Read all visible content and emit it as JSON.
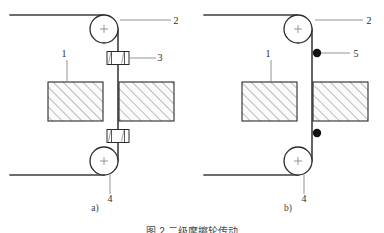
{
  "figure": {
    "caption": "图 2  二级摩擦轮传动",
    "panels": [
      {
        "id": "a",
        "label": "a)",
        "label_x": 95,
        "label_y": 211,
        "origin_x": 0,
        "callouts": [
          {
            "id": "1",
            "text": "1",
            "text_x": 64,
            "text_y": 57,
            "leader": "vertical",
            "lx1": 67,
            "ly1": 60,
            "lx2": 67,
            "ly2": 82
          },
          {
            "id": "2",
            "text": "2",
            "text_x": 176,
            "text_y": 24,
            "leader": "horizontal",
            "lx1": 120,
            "ly1": 20,
            "lx2": 171,
            "ly2": 20
          },
          {
            "id": "3",
            "text": "3",
            "text_x": 160,
            "text_y": 61,
            "leader": "horizontal",
            "lx1": 124,
            "ly1": 58,
            "lx2": 156,
            "ly2": 58
          },
          {
            "id": "4",
            "text": "4",
            "text_x": 108,
            "text_y": 200,
            "leader": "vertical",
            "lx1": 110,
            "ly1": 175,
            "lx2": 110,
            "ly2": 194
          }
        ],
        "pulleys": [
          {
            "name": "top-pulley",
            "cx": 104,
            "cy": 29,
            "r": 14
          },
          {
            "name": "bottom-pulley",
            "cx": 104,
            "cy": 161,
            "r": 14
          }
        ],
        "blocks": [
          {
            "name": "left-block",
            "x": 48,
            "y": 82,
            "w": 55,
            "h": 39
          },
          {
            "name": "right-block",
            "x": 119,
            "y": 82,
            "w": 55,
            "h": 39
          }
        ],
        "belt": {
          "top_run_x1": 10,
          "top_run_y": 15,
          "top_run_x2": 104,
          "bottom_run_x1": 10,
          "bottom_run_y": 175,
          "bottom_run_x2": 104,
          "vertical_x": 118,
          "vertical_y1": 29,
          "vertical_y2": 161
        },
        "clamps": [
          {
            "name": "clamp-upper",
            "cx": 118,
            "cy": 58,
            "w": 22,
            "h": 13
          },
          {
            "name": "clamp-lower",
            "cx": 118,
            "cy": 136,
            "w": 22,
            "h": 13
          }
        ],
        "dots": []
      },
      {
        "id": "b",
        "label": "b)",
        "label_x": 288,
        "label_y": 211,
        "origin_x": 192,
        "callouts": [
          {
            "id": "1",
            "text": "1",
            "text_x": 268,
            "text_y": 57,
            "leader": "vertical",
            "lx1": 271,
            "ly1": 60,
            "lx2": 271,
            "ly2": 82
          },
          {
            "id": "2",
            "text": "2",
            "text_x": 368,
            "text_y": 24,
            "leader": "horizontal",
            "lx1": 315,
            "ly1": 20,
            "lx2": 363,
            "ly2": 20
          },
          {
            "id": "5",
            "text": "5",
            "text_x": 355,
            "text_y": 57,
            "leader": "horizontal",
            "lx1": 320,
            "ly1": 53,
            "lx2": 350,
            "ly2": 53
          },
          {
            "id": "4",
            "text": "4",
            "text_x": 302,
            "text_y": 200,
            "leader": "vertical",
            "lx1": 304,
            "ly1": 175,
            "lx2": 304,
            "ly2": 194
          }
        ],
        "pulleys": [
          {
            "name": "top-pulley",
            "cx": 298,
            "cy": 29,
            "r": 14
          },
          {
            "name": "bottom-pulley",
            "cx": 298,
            "cy": 161,
            "r": 14
          }
        ],
        "blocks": [
          {
            "name": "left-block",
            "x": 242,
            "y": 82,
            "w": 55,
            "h": 39
          },
          {
            "name": "right-block",
            "x": 313,
            "y": 82,
            "w": 55,
            "h": 39
          }
        ],
        "belt": {
          "top_run_x1": 204,
          "top_run_y": 15,
          "top_run_x2": 298,
          "bottom_run_x1": 204,
          "bottom_run_y": 175,
          "bottom_run_x2": 298,
          "vertical_x": 312,
          "vertical_y1": 29,
          "vertical_y2": 161
        },
        "clamps": [],
        "dots": [
          {
            "name": "node-upper",
            "cx": 317,
            "cy": 53,
            "r": 4.2
          },
          {
            "name": "node-lower",
            "cx": 317,
            "cy": 133,
            "r": 4.2
          }
        ]
      }
    ]
  },
  "colors": {
    "line": "#2b2b2b",
    "belt": "#3d3d3d",
    "hatch": "#6e6e6e",
    "block_fill": "#fbfbfb",
    "dot": "#111111",
    "leader": "#7a7a7a",
    "text": "#2b2b2b",
    "background": "#ffffff"
  }
}
